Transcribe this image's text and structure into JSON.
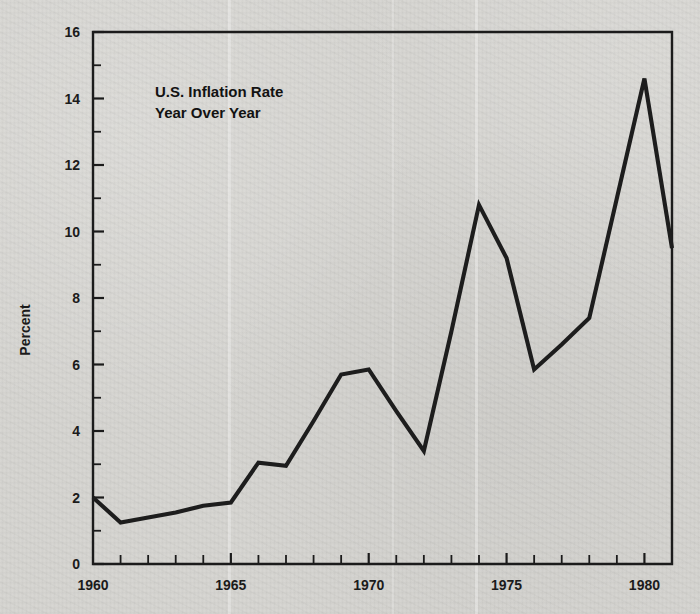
{
  "chart_data": {
    "type": "line",
    "title": "U.S. Inflation Rate",
    "subtitle": "Year Over Year",
    "xlabel": "",
    "ylabel": "Percent",
    "xlim": [
      1960,
      1981
    ],
    "ylim": [
      0,
      16
    ],
    "grid": false,
    "legend": "none",
    "y_major_step": 2,
    "y_minor_step": 1,
    "x_major_step": 5,
    "x_minor_step": 1,
    "x_tick_labels": [
      "1960",
      "1965",
      "1970",
      "1975",
      "1980"
    ],
    "x_tick_label_values": [
      1960,
      1965,
      1970,
      1975,
      1980
    ],
    "y_tick_labels": [
      "0",
      "2",
      "4",
      "6",
      "8",
      "10",
      "12",
      "14",
      "16"
    ],
    "y_tick_label_values": [
      0,
      2,
      4,
      6,
      8,
      10,
      12,
      14,
      16
    ],
    "x": [
      1960,
      1961,
      1962,
      1963,
      1964,
      1965,
      1966,
      1967,
      1968,
      1969,
      1970,
      1971,
      1972,
      1973,
      1974,
      1975,
      1976,
      1977,
      1978,
      1979,
      1980,
      1981
    ],
    "values": [
      2.0,
      1.25,
      1.4,
      1.55,
      1.75,
      1.85,
      3.05,
      2.95,
      4.3,
      5.7,
      5.85,
      4.6,
      3.4,
      7.0,
      10.8,
      9.2,
      5.85,
      6.6,
      7.4,
      11.0,
      14.6,
      9.5
    ],
    "series": [
      {
        "name": "U.S. Inflation Rate",
        "values": [
          2.0,
          1.25,
          1.4,
          1.55,
          1.75,
          1.85,
          3.05,
          2.95,
          4.3,
          5.7,
          5.85,
          4.6,
          3.4,
          7.0,
          10.8,
          9.2,
          5.85,
          6.6,
          7.4,
          11.0,
          14.6,
          9.5
        ]
      }
    ],
    "line_color": "#1d1d1d",
    "background_color": "#d5d4d0",
    "axis_color": "#1b1b1b"
  },
  "annotations": {
    "title_line_1": "U.S. Inflation Rate",
    "title_line_2": "Year Over Year"
  }
}
